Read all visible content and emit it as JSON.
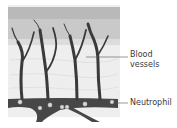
{
  "diagram": {
    "labels": {
      "blood_vessels": "Blood\nvessels",
      "blood_vessels_line1": "Blood",
      "blood_vessels_line2": "vessels",
      "neutrophil": "Neutrophil"
    },
    "colors": {
      "background": "#ffffff",
      "tissue": "#e9e9e9",
      "tissue_light": "#f3f3f3",
      "top_layer": "#b8b8b8",
      "vessel": "#3c3c3c",
      "cell": "#d8d8d8",
      "label_text": "#3a3a3a",
      "leader_line": "#555555"
    }
  }
}
